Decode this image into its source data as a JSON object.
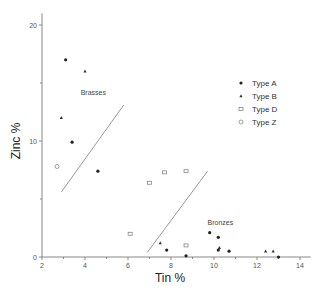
{
  "chart_data": {
    "type": "scatter",
    "title": "",
    "xlabel": "Tin %",
    "ylabel": "Zinc %",
    "xlim": [
      2,
      14.5
    ],
    "ylim": [
      0,
      21
    ],
    "xticks": [
      2,
      4,
      6,
      8,
      10,
      12,
      14
    ],
    "xminor": [
      3,
      5,
      7,
      9,
      11,
      13
    ],
    "yticks": [
      0,
      10,
      20
    ],
    "yminor": [
      5,
      15
    ],
    "grid": false,
    "legend_position": "upper right",
    "series": [
      {
        "name": "Type A",
        "marker": "filled-dot",
        "points": [
          [
            3.1,
            17.0
          ],
          [
            3.4,
            9.9
          ],
          [
            4.6,
            7.4
          ],
          [
            7.8,
            0.6
          ],
          [
            9.8,
            2.1
          ],
          [
            10.2,
            1.7
          ],
          [
            10.2,
            0.6
          ],
          [
            10.7,
            0.5
          ],
          [
            13.0,
            0.0
          ],
          [
            8.7,
            0.1
          ]
        ]
      },
      {
        "name": "Type B",
        "marker": "small-triangle",
        "points": [
          [
            4.0,
            16.0
          ],
          [
            2.9,
            12.0
          ],
          [
            7.5,
            1.2
          ],
          [
            10.25,
            0.8
          ],
          [
            12.4,
            0.5
          ],
          [
            12.75,
            0.5
          ]
        ]
      },
      {
        "name": "Type D",
        "marker": "open-square",
        "points": [
          [
            7.0,
            6.4
          ],
          [
            7.7,
            7.3
          ],
          [
            8.7,
            7.4
          ],
          [
            6.1,
            2.0
          ],
          [
            8.7,
            1.0
          ]
        ]
      },
      {
        "name": "Type Z",
        "marker": "open-circle",
        "points": [
          [
            2.7,
            7.8
          ]
        ]
      }
    ],
    "divider_lines": [
      {
        "from": [
          2.9,
          5.6
        ],
        "to": [
          5.8,
          13.1
        ]
      },
      {
        "from": [
          6.9,
          0.4
        ],
        "to": [
          9.7,
          7.4
        ]
      }
    ],
    "annotations": [
      {
        "text": "Brasses",
        "x": 3.8,
        "y": 14.0
      },
      {
        "text": "Bronzes",
        "x": 9.7,
        "y": 2.8
      }
    ]
  }
}
